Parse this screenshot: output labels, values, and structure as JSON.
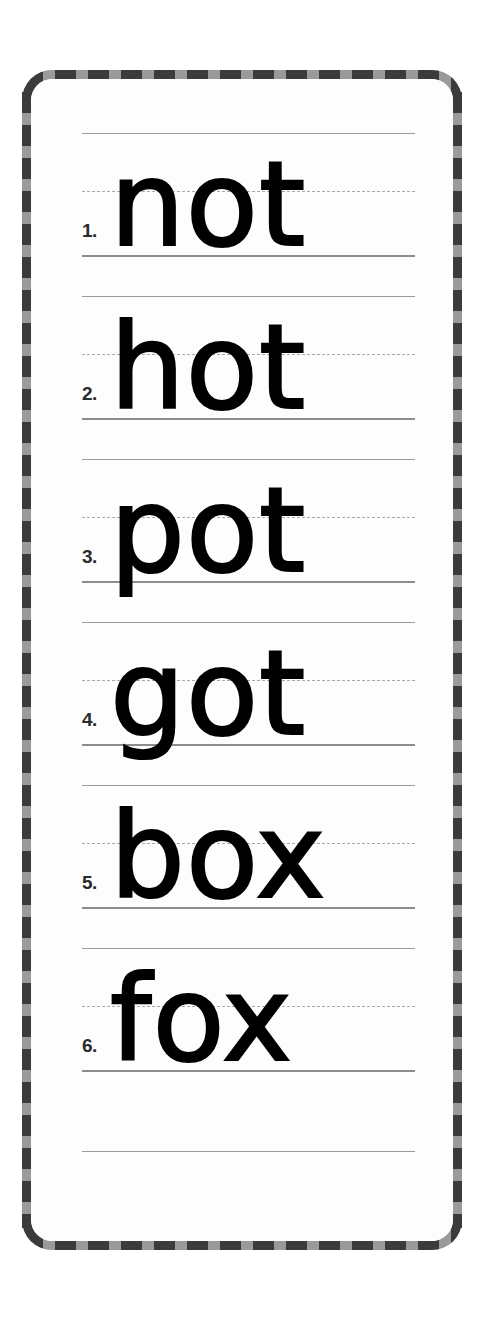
{
  "page": {
    "background_color": "#ffffff"
  },
  "card": {
    "frame_style": "dashed-checkered",
    "frame_colors": [
      "#3b3b3b",
      "#9a9a9a"
    ],
    "sheet_color": "#fdfdfd"
  },
  "guide_lines": {
    "top_line_color": "#9b9b9b",
    "mid_line_color": "#a9a9a9",
    "baseline_color": "#8d8d8d",
    "mid_line_style": "dashed"
  },
  "worksheet": {
    "text_color": "#000000",
    "rows": [
      {
        "number": "1.",
        "word": "not"
      },
      {
        "number": "2.",
        "word": "hot"
      },
      {
        "number": "3.",
        "word": "pot"
      },
      {
        "number": "4.",
        "word": "got"
      },
      {
        "number": "5.",
        "word": "box"
      },
      {
        "number": "6.",
        "word": "fox"
      }
    ]
  }
}
